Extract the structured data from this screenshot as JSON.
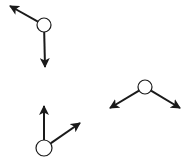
{
  "canvas": {
    "width": 192,
    "height": 160,
    "background": "#ffffff"
  },
  "colors": {
    "stroke": "#1a1a1a",
    "node_fill": "#ffffff"
  },
  "nodes": [
    {
      "id": "node-top-left",
      "cx": 44,
      "cy": 25,
      "r": 7,
      "arrows": [
        {
          "direction": "up-left",
          "x2": 10,
          "y2": 6
        },
        {
          "direction": "down",
          "x2": 45,
          "y2": 67
        }
      ]
    },
    {
      "id": "node-right",
      "cx": 145,
      "cy": 87,
      "r": 7,
      "arrows": [
        {
          "direction": "down-left",
          "x2": 110,
          "y2": 108
        },
        {
          "direction": "down-right",
          "x2": 180,
          "y2": 108
        }
      ]
    },
    {
      "id": "node-bottom-left",
      "cx": 44,
      "cy": 148,
      "r": 8,
      "arrows": [
        {
          "direction": "up",
          "x2": 44,
          "y2": 106
        },
        {
          "direction": "up-right",
          "x2": 80,
          "y2": 123
        }
      ]
    }
  ]
}
